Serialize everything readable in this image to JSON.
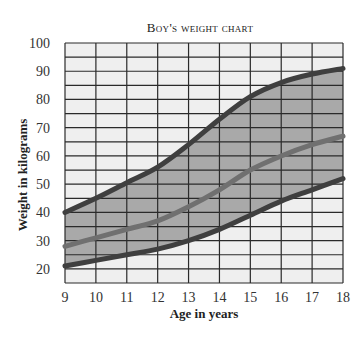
{
  "chart_data": {
    "type": "line",
    "title": "Boy's weight chart",
    "xlabel": "Age in years",
    "ylabel": "Weight in kilograms",
    "x": [
      9,
      10,
      11,
      12,
      13,
      14,
      15,
      16,
      17,
      18
    ],
    "x_tick_labels": [
      "9",
      "10",
      "11",
      "12",
      "13",
      "14",
      "15",
      "16",
      "17",
      "18"
    ],
    "y_tick_labels": [
      "100",
      "90",
      "80",
      "70",
      "60",
      "50",
      "40",
      "30",
      "20"
    ],
    "y_ticks": [
      100,
      90,
      80,
      70,
      60,
      50,
      40,
      30,
      20
    ],
    "xlim": [
      9,
      18
    ],
    "ylim": [
      15,
      100
    ],
    "grid": true,
    "grid_y_step": 5,
    "grid_x_step": 1,
    "legend": null,
    "shaded_band": {
      "between": [
        "Upper limit",
        "Lower limit"
      ],
      "color": "#a9a9a9"
    },
    "series": [
      {
        "name": "Upper limit",
        "color": "#3f3f3f",
        "values": [
          40,
          45,
          50.5,
          56,
          64,
          73,
          81,
          86,
          89,
          91
        ]
      },
      {
        "name": "Average",
        "color": "#707070",
        "values": [
          28,
          31,
          34,
          37,
          42,
          48,
          55,
          60,
          64,
          67
        ]
      },
      {
        "name": "Lower limit",
        "color": "#3f3f3f",
        "values": [
          21,
          23,
          25,
          27,
          30,
          34,
          39,
          44,
          48,
          52
        ]
      }
    ]
  },
  "colors": {
    "plot_background": "#efefef",
    "grid": "#2a2a2a",
    "band": "#a9a9a9"
  }
}
